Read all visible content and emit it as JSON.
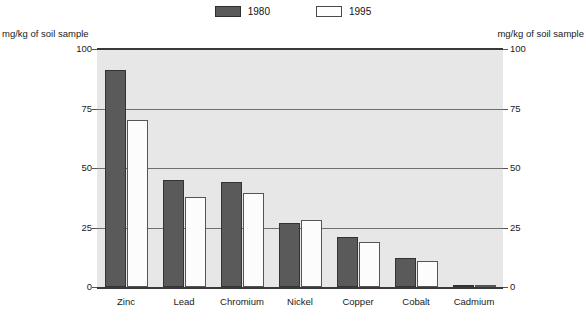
{
  "chart_data": {
    "type": "bar",
    "title": "",
    "subtitle": "",
    "xlabel": "",
    "ylabel": "mg/kg of soil sample",
    "ylabel_right": "mg/kg of soil sample",
    "ylim": [
      0,
      100
    ],
    "yticks": [
      0,
      25,
      50,
      75,
      100
    ],
    "ytick_labels": [
      "0",
      "25",
      "50",
      "75",
      "100"
    ],
    "grid": true,
    "grid_axis": "y",
    "legend_position": "top-center",
    "categories": [
      "Zinc",
      "Lead",
      "Chromium",
      "Nickel",
      "Copper",
      "Cobalt",
      "Cadmium"
    ],
    "series": [
      {
        "name": "1980",
        "color": "#5a5a5a",
        "values": [
          91,
          45,
          44,
          27,
          21,
          12,
          1
        ]
      },
      {
        "name": "1995",
        "color": "#fcfcfc",
        "values": [
          70,
          38,
          39.5,
          28,
          19,
          11,
          1
        ]
      }
    ]
  },
  "legend": {
    "entries": [
      {
        "label": "1980"
      },
      {
        "label": "1995"
      }
    ]
  },
  "axis": {
    "unit_left": "mg/kg of soil sample",
    "unit_right": "mg/kg of soil sample",
    "ticks": [
      {
        "value": 100,
        "label": "100"
      },
      {
        "value": 75,
        "label": "75"
      },
      {
        "value": 50,
        "label": "50"
      },
      {
        "value": 25,
        "label": "25"
      },
      {
        "value": 0,
        "label": "0"
      }
    ]
  },
  "colors": {
    "series_1980": "#5a5a5a",
    "series_1995": "#fcfcfc",
    "plot_background": "#e7e7e7",
    "page_background": "#ffffff",
    "gridline": "#6f6f6f",
    "axis_rule": "#3a3a3a"
  }
}
